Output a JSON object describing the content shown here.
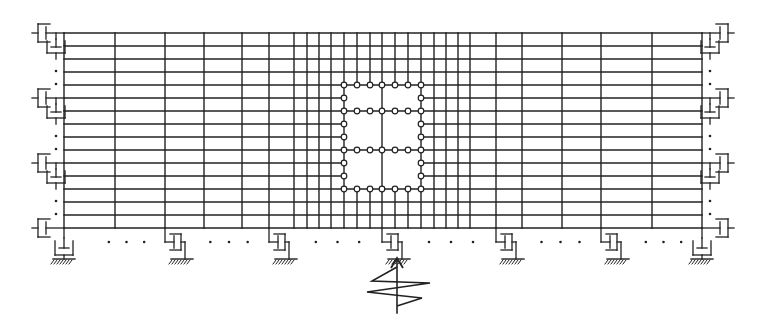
{
  "diagram": {
    "title": "",
    "stroke_color": "#222222",
    "background": "#ffffff",
    "grid": {
      "x_lines": [
        64,
        115,
        165,
        204,
        242,
        269,
        294,
        307,
        319,
        331,
        344,
        357,
        370,
        382,
        395,
        408,
        421,
        434,
        446,
        458,
        470,
        496,
        522,
        562,
        601,
        652,
        702
      ],
      "y_lines": [
        33,
        46,
        59,
        72,
        85,
        98,
        111,
        124,
        137,
        150,
        163,
        176,
        189,
        202,
        215,
        228
      ]
    },
    "opening": {
      "x_range": [
        344,
        421
      ],
      "y_range": [
        85,
        189
      ],
      "inner_h_lines": [
        111,
        150
      ],
      "inner_v_lines": [
        382
      ],
      "node_x": [
        344,
        357,
        370,
        382,
        395,
        408,
        421
      ],
      "node_y": [
        85,
        98,
        111,
        124,
        137,
        150,
        163,
        176,
        189
      ]
    },
    "side_dampers": {
      "levels_y": [
        33,
        98,
        163,
        228
      ],
      "left_x": 64,
      "right_x": 702
    },
    "bottom_dampers": {
      "x": [
        64,
        165,
        269,
        382,
        496,
        601,
        702
      ],
      "base_y": 228
    },
    "seismic_input": {
      "x": 397,
      "label": "ground-motion-input"
    }
  }
}
